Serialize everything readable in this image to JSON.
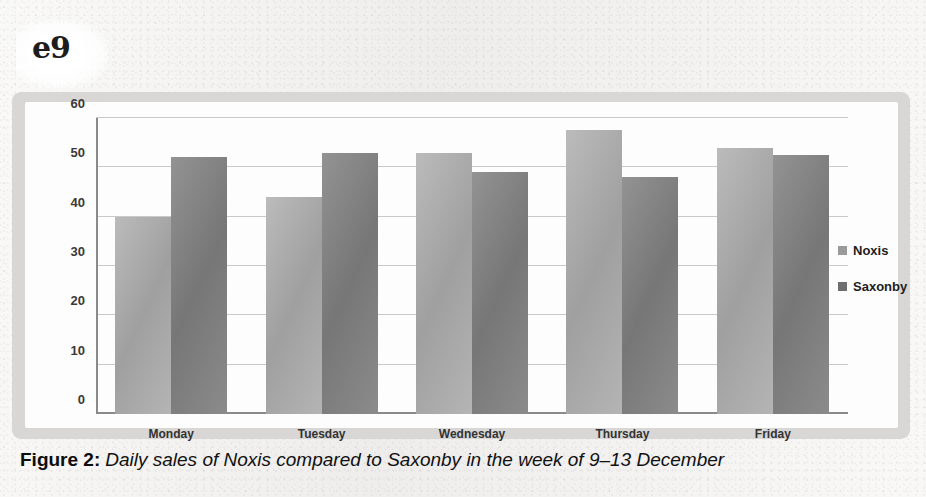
{
  "page_marker": "e9",
  "caption": {
    "label": "Figure 2:",
    "text": "Daily sales of Noxis compared to Saxonby in the week of 9–13 December"
  },
  "legend": {
    "items": [
      {
        "label": "Noxis",
        "color": "#9a9a9a"
      },
      {
        "label": "Saxonby",
        "color": "#6e6e6e"
      }
    ]
  },
  "chart_data": {
    "type": "bar",
    "title": "",
    "subtitle": "",
    "xlabel": "",
    "ylabel": "",
    "categories": [
      "Monday",
      "Tuesday",
      "Wednesday",
      "Thursday",
      "Friday"
    ],
    "series": [
      {
        "name": "Noxis",
        "color": "#a8a8a8",
        "values": [
          40,
          44,
          53,
          57.5,
          54
        ]
      },
      {
        "name": "Saxonby",
        "color": "#7e7e7e",
        "values": [
          52,
          53,
          49,
          48,
          52.5
        ]
      }
    ],
    "ylim": [
      0,
      60
    ],
    "yticks": [
      0,
      10,
      20,
      30,
      40,
      50,
      60
    ],
    "ytick_labels": [
      "0",
      "10",
      "20",
      "30",
      "40",
      "50",
      "60"
    ],
    "grid": true,
    "grid_axis": "y",
    "legend_position": "right",
    "annotations": []
  }
}
